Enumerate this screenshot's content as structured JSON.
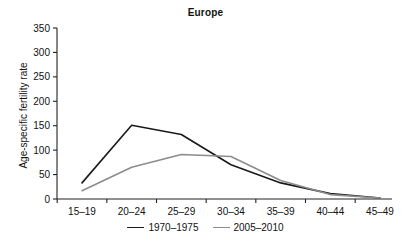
{
  "chart_data": {
    "type": "line",
    "title": "Europe",
    "xlabel": "",
    "ylabel": "Age-specific fertility rate",
    "categories": [
      "15–19",
      "20–24",
      "25–29",
      "30–34",
      "35–39",
      "40–44",
      "45–49"
    ],
    "ylim": [
      0,
      350
    ],
    "yticks": [
      0,
      50,
      100,
      150,
      200,
      250,
      300,
      350
    ],
    "ytick_labels": [
      "0",
      "50",
      "100",
      "150",
      "200",
      "250",
      "300",
      "350"
    ],
    "grid": false,
    "legend_position": "bottom-center",
    "series": [
      {
        "name": "1970–1975",
        "color": "#1a1a1a",
        "values": [
          33,
          151,
          132,
          70,
          33,
          11,
          2
        ]
      },
      {
        "name": "2005–2010",
        "color": "#8c8c8c",
        "values": [
          17,
          65,
          91,
          87,
          38,
          9,
          2
        ]
      }
    ]
  },
  "legend": {
    "entries": [
      {
        "label": "1970–1975",
        "color": "#1a1a1a"
      },
      {
        "label": "2005–2010",
        "color": "#8c8c8c"
      }
    ]
  }
}
